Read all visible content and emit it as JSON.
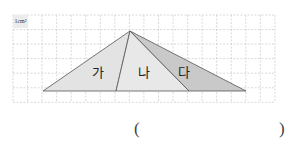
{
  "figure": {
    "unit_label": "1cm²",
    "grid": {
      "cols": 18,
      "rows": 6,
      "cell_px": 14.55,
      "origin_x": 13,
      "origin_y": 15,
      "line_color": "#c8c8c8"
    },
    "apex": [
      130,
      31
    ],
    "base_y": 91,
    "base_points_x": [
      43,
      116,
      189,
      246
    ],
    "regions": [
      {
        "name": "가",
        "fill": "#e3e3e3",
        "label_x": 92,
        "label_y": 66
      },
      {
        "name": "나",
        "fill": "#e8e8e8",
        "label_x": 138,
        "label_y": 66
      },
      {
        "name": "다",
        "fill": "#c9c9c9",
        "label_x": 178,
        "label_y": 66
      }
    ],
    "outline_color": "#555555"
  },
  "answer": {
    "open_paren": "(",
    "close_paren": ")"
  }
}
